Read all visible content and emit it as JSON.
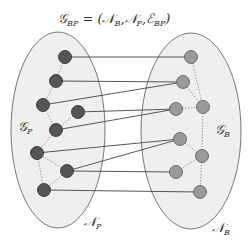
{
  "title": {
    "main": "𝒢",
    "sub": "BP",
    "rest": " = (𝒩",
    "sub2": "B",
    "mid": ",𝒩",
    "sub3": "P",
    "mid2": ",ℰ",
    "sub4": "BP",
    "end": ")"
  },
  "labels": {
    "gp": {
      "main": "𝒢",
      "sub": "P"
    },
    "gb": {
      "main": "𝒢",
      "sub": "B"
    },
    "np": {
      "main": "𝒩",
      "sub": "P"
    },
    "nb": {
      "main": "𝒩",
      "sub": "B"
    }
  },
  "colors": {
    "ellipse_fill": "#efefef",
    "node_p": "#555555",
    "node_b": "#9a9a9a",
    "edge": "#444444"
  },
  "nodes_p": [
    {
      "id": "L1",
      "x": 65,
      "y": 57
    },
    {
      "id": "L2",
      "x": 56,
      "y": 81
    },
    {
      "id": "L3",
      "x": 43,
      "y": 105
    },
    {
      "id": "L4",
      "x": 78,
      "y": 112
    },
    {
      "id": "L5",
      "x": 56,
      "y": 130
    },
    {
      "id": "L6",
      "x": 37,
      "y": 153
    },
    {
      "id": "L7",
      "x": 67,
      "y": 171
    },
    {
      "id": "L8",
      "x": 44,
      "y": 190
    }
  ],
  "nodes_b": [
    {
      "id": "R1",
      "x": 191,
      "y": 57
    },
    {
      "id": "R2",
      "x": 183,
      "y": 82
    },
    {
      "id": "R3",
      "x": 176,
      "y": 109
    },
    {
      "id": "R4",
      "x": 203,
      "y": 107
    },
    {
      "id": "R5",
      "x": 180,
      "y": 139
    },
    {
      "id": "R6",
      "x": 202,
      "y": 156
    },
    {
      "id": "R7",
      "x": 176,
      "y": 172
    },
    {
      "id": "R8",
      "x": 200,
      "y": 192
    }
  ],
  "edges_bp": [
    [
      "L1",
      "R1"
    ],
    [
      "L2",
      "R2"
    ],
    [
      "L3",
      "R2"
    ],
    [
      "L4",
      "R3"
    ],
    [
      "L5",
      "R3"
    ],
    [
      "L6",
      "R5"
    ],
    [
      "L7",
      "R5"
    ],
    [
      "L7",
      "R7"
    ],
    [
      "L8",
      "R8"
    ]
  ],
  "edges_p": [
    [
      "L1",
      "L2"
    ],
    [
      "L2",
      "L3"
    ],
    [
      "L3",
      "L5"
    ],
    [
      "L4",
      "L5"
    ],
    [
      "L5",
      "L6"
    ],
    [
      "L6",
      "L7"
    ],
    [
      "L6",
      "L8"
    ],
    [
      "L7",
      "L8"
    ]
  ],
  "edges_b": [
    [
      "R1",
      "R4"
    ],
    [
      "R2",
      "R4"
    ],
    [
      "R3",
      "R4"
    ],
    [
      "R4",
      "R6"
    ],
    [
      "R5",
      "R6"
    ],
    [
      "R6",
      "R7"
    ],
    [
      "R6",
      "R8"
    ]
  ]
}
